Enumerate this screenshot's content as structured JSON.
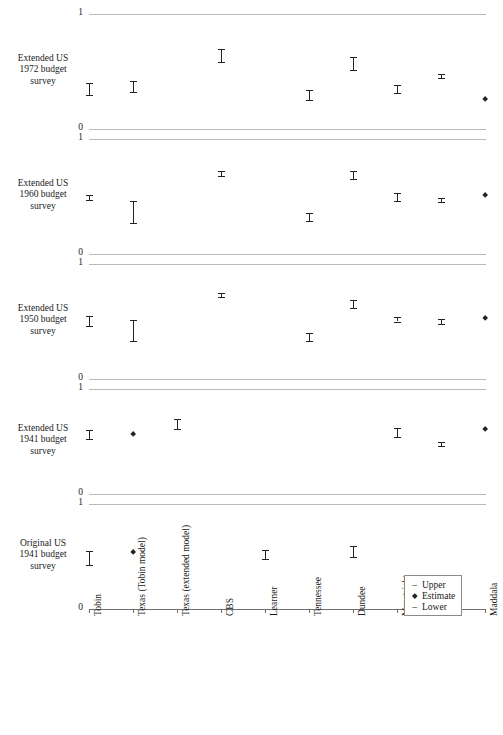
{
  "chart_data": {
    "type": "scatter",
    "title": "",
    "xlabel": "",
    "ylabel": "",
    "ylim": [
      0,
      1
    ],
    "grid": true,
    "legend": {
      "position": "bottom-right",
      "entries": [
        {
          "glyph": "dash",
          "label": "Upper"
        },
        {
          "glyph": "dot",
          "label": "Estimate"
        },
        {
          "glyph": "dash",
          "label": "Lower"
        }
      ]
    },
    "yticks": [
      "1",
      "0"
    ],
    "categories": [
      "Tobin",
      "Texas (Tobin model)",
      "Texas (extended model)",
      "CBS",
      "Learner",
      "Tennessee",
      "Dundee",
      "Maastricht",
      "Finland",
      "Maddala"
    ],
    "panels": [
      {
        "name": "extended-us-1972-budget-survey",
        "label": "Extended US\n1972 budget\nsurvey",
        "label_lines": [
          "Extended US",
          "1972 budget",
          "survey"
        ],
        "points": [
          {
            "category": "Tobin",
            "estimate": 0.35,
            "lower": 0.3,
            "upper": 0.4
          },
          {
            "category": "Texas (Tobin model)",
            "estimate": 0.37,
            "lower": 0.32,
            "upper": 0.42
          },
          {
            "category": "Texas (extended model)",
            "estimate": null,
            "lower": null,
            "upper": null
          },
          {
            "category": "CBS",
            "estimate": 0.64,
            "lower": 0.58,
            "upper": 0.7
          },
          {
            "category": "Learner",
            "estimate": null,
            "lower": null,
            "upper": null
          },
          {
            "category": "Tennessee",
            "estimate": 0.29,
            "lower": 0.25,
            "upper": 0.34
          },
          {
            "category": "Dundee",
            "estimate": 0.57,
            "lower": 0.51,
            "upper": 0.63
          },
          {
            "category": "Maastricht",
            "estimate": 0.34,
            "lower": 0.31,
            "upper": 0.38
          },
          {
            "category": "Finland",
            "estimate": 0.46,
            "lower": 0.44,
            "upper": 0.48
          },
          {
            "category": "Maddala",
            "estimate": 0.26,
            "lower": null,
            "upper": null
          }
        ]
      },
      {
        "name": "extended-us-1960-budget-survey",
        "label": "Extended US\n1960 budget\nsurvey",
        "label_lines": [
          "Extended US",
          "1960 budget",
          "survey"
        ],
        "points": [
          {
            "category": "Tobin",
            "estimate": 0.49,
            "lower": 0.47,
            "upper": 0.51
          },
          {
            "category": "Texas (Tobin model)",
            "estimate": 0.37,
            "lower": 0.27,
            "upper": 0.46
          },
          {
            "category": "Texas (extended model)",
            "estimate": null,
            "lower": null,
            "upper": null
          },
          {
            "category": "CBS",
            "estimate": 0.7,
            "lower": 0.68,
            "upper": 0.72
          },
          {
            "category": "Learner",
            "estimate": null,
            "lower": null,
            "upper": null
          },
          {
            "category": "Tennessee",
            "estimate": 0.32,
            "lower": 0.29,
            "upper": 0.36
          },
          {
            "category": "Dundee",
            "estimate": 0.68,
            "lower": 0.65,
            "upper": 0.72
          },
          {
            "category": "Maastricht",
            "estimate": 0.49,
            "lower": 0.46,
            "upper": 0.53
          },
          {
            "category": "Finland",
            "estimate": 0.47,
            "lower": 0.45,
            "upper": 0.49
          },
          {
            "category": "Maddala",
            "estimate": 0.51,
            "lower": null,
            "upper": null
          }
        ]
      },
      {
        "name": "extended-us-1950-budget-survey",
        "label": "Extended US\n1950 budget\nsurvey",
        "label_lines": [
          "Extended US",
          "1950 budget",
          "survey"
        ],
        "points": [
          {
            "category": "Tobin",
            "estimate": 0.5,
            "lower": 0.46,
            "upper": 0.55
          },
          {
            "category": "Texas (Tobin model)",
            "estimate": 0.42,
            "lower": 0.33,
            "upper": 0.51
          },
          {
            "category": "Texas (extended model)",
            "estimate": null,
            "lower": null,
            "upper": null
          },
          {
            "category": "CBS",
            "estimate": 0.73,
            "lower": 0.71,
            "upper": 0.75
          },
          {
            "category": "Learner",
            "estimate": null,
            "lower": null,
            "upper": null
          },
          {
            "category": "Tennessee",
            "estimate": 0.36,
            "lower": 0.33,
            "upper": 0.4
          },
          {
            "category": "Dundee",
            "estimate": 0.65,
            "lower": 0.62,
            "upper": 0.69
          },
          {
            "category": "Maastricht",
            "estimate": 0.52,
            "lower": 0.5,
            "upper": 0.54
          },
          {
            "category": "Finland",
            "estimate": 0.5,
            "lower": 0.48,
            "upper": 0.52
          },
          {
            "category": "Maddala",
            "estimate": 0.53,
            "lower": null,
            "upper": null
          }
        ]
      },
      {
        "name": "extended-us-1941-budget-survey",
        "label": "Extended US\n1941 budget\nsurvey",
        "label_lines": [
          "Extended US",
          "1941 budget",
          "survey"
        ],
        "points": [
          {
            "category": "Tobin",
            "estimate": 0.56,
            "lower": 0.52,
            "upper": 0.61
          },
          {
            "category": "Texas (Tobin model)",
            "estimate": 0.57,
            "lower": null,
            "upper": null
          },
          {
            "category": "Texas (extended model)",
            "estimate": 0.66,
            "lower": 0.62,
            "upper": 0.71
          },
          {
            "category": "CBS",
            "estimate": null,
            "lower": null,
            "upper": null
          },
          {
            "category": "Learner",
            "estimate": null,
            "lower": null,
            "upper": null
          },
          {
            "category": "Tennessee",
            "estimate": null,
            "lower": null,
            "upper": null
          },
          {
            "category": "Dundee",
            "estimate": null,
            "lower": null,
            "upper": null
          },
          {
            "category": "Maastricht",
            "estimate": 0.58,
            "lower": 0.54,
            "upper": 0.63
          },
          {
            "category": "Finland",
            "estimate": 0.48,
            "lower": 0.46,
            "upper": 0.5
          },
          {
            "category": "Maddala",
            "estimate": 0.62,
            "lower": null,
            "upper": null
          }
        ]
      },
      {
        "name": "original-us-1941-budget-survey",
        "label": "Original US\n1941 budget\nsurvey",
        "label_lines": [
          "Original US",
          "1941 budget",
          "survey"
        ],
        "points": [
          {
            "category": "Tobin",
            "estimate": 0.48,
            "lower": 0.42,
            "upper": 0.55
          },
          {
            "category": "Texas (Tobin model)",
            "estimate": 0.54,
            "lower": null,
            "upper": null
          },
          {
            "category": "Texas (extended model)",
            "estimate": null,
            "lower": null,
            "upper": null
          },
          {
            "category": "CBS",
            "estimate": null,
            "lower": null,
            "upper": null
          },
          {
            "category": "Learner",
            "estimate": 0.52,
            "lower": 0.48,
            "upper": 0.56
          },
          {
            "category": "Tennessee",
            "estimate": null,
            "lower": null,
            "upper": null
          },
          {
            "category": "Dundee",
            "estimate": 0.55,
            "lower": 0.5,
            "upper": 0.6
          },
          {
            "category": "Maastricht",
            "estimate": null,
            "lower": null,
            "upper": null
          },
          {
            "category": "Finland",
            "estimate": null,
            "lower": null,
            "upper": null
          },
          {
            "category": "Maddala",
            "estimate": null,
            "lower": null,
            "upper": null
          }
        ]
      }
    ]
  },
  "layout": {
    "panel_tops": [
      14,
      139,
      264,
      389,
      504
    ],
    "panel_bottoms": [
      129,
      254,
      379,
      494,
      609
    ],
    "x_left": 89,
    "x_right": 485
  }
}
